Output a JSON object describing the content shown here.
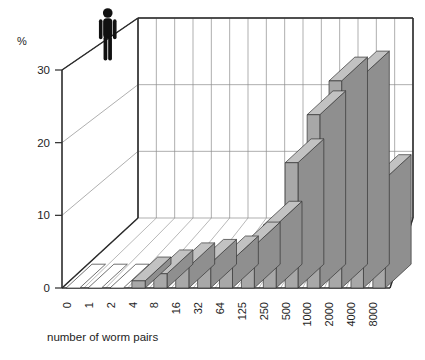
{
  "figure": {
    "caption": "number of worm pairs",
    "y_axis_unit_label": "%",
    "person_icon": "human-silhouette-icon"
  },
  "chart_data": {
    "type": "bar",
    "title": "",
    "subtitle": "",
    "xlabel": "number of worm pairs",
    "ylabel": "%",
    "categories": [
      "0",
      "1",
      "2",
      "4",
      "8",
      "16",
      "32",
      "64",
      "125",
      "250",
      "500",
      "1000",
      "2000",
      "4000",
      "8000"
    ],
    "values": [
      0,
      0,
      0,
      1,
      2,
      3,
      3.5,
      4,
      6,
      9,
      18,
      25,
      30,
      31,
      16
    ],
    "ytick_labels": [
      "0",
      "10",
      "20",
      "30"
    ],
    "ytick_values": [
      0,
      10,
      20,
      30
    ],
    "ylim": [
      0,
      35
    ],
    "grid": true,
    "legend": "none",
    "projection": "3d-perspective",
    "bar_color": "#a8a8a8",
    "bar_edge_color": "#333333",
    "annotations": [
      "human-silhouette-icon above upper-left of plot box"
    ]
  }
}
